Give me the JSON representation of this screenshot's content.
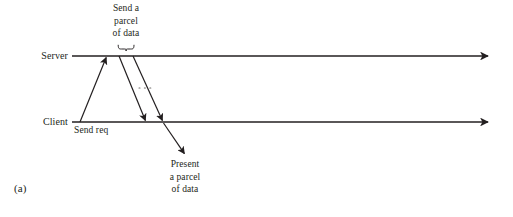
{
  "figure": {
    "caption": "(a)",
    "type": "sequence-timing-diagram",
    "background_color": "#ffffff",
    "line_color": "#231f20",
    "text_color": "#231f20"
  },
  "timelines": [
    {
      "id": "server",
      "label": "Server",
      "y": 56,
      "x_start": 72,
      "x_end": 492,
      "arrowhead": "right"
    },
    {
      "id": "client",
      "label": "Client",
      "y": 122,
      "x_start": 72,
      "x_end": 492,
      "arrowhead": "right"
    }
  ],
  "messages": [
    {
      "id": "send-req",
      "label": "Send req",
      "from": "client",
      "to": "server",
      "x_from": 80,
      "y_from": 122,
      "x_to": 107,
      "y_to": 56,
      "arrowhead": "end"
    },
    {
      "id": "parcel-1",
      "label": "",
      "from": "server",
      "to": "client",
      "x_from": 119,
      "y_from": 56,
      "x_to": 146,
      "y_to": 122,
      "arrowhead": "end"
    },
    {
      "id": "parcel-2",
      "label": "",
      "from": "server",
      "to": "client",
      "x_from": 133,
      "y_from": 56,
      "x_to": 163,
      "y_to": 122,
      "arrowhead": "end"
    },
    {
      "id": "present",
      "label": "Present a parcel of data",
      "from": "client",
      "to": "annotation",
      "x_from": 163,
      "y_from": 122,
      "x_to": 185,
      "y_to": 155,
      "arrowhead": "end"
    }
  ],
  "ellipsis": {
    "id": "continuation-dots",
    "x_start": 138,
    "x_end": 155,
    "y": 88,
    "style": "dotted"
  },
  "brace": {
    "id": "parcel-brace",
    "x_start": 118,
    "x_end": 134,
    "y": 46,
    "orientation": "down"
  },
  "annotations": {
    "send_parcel": {
      "line1": "Send a",
      "line2": "parcel",
      "line3": "of data"
    },
    "send_req": {
      "line1": "Send req"
    },
    "present": {
      "line1": "Present",
      "line2": "a parcel",
      "line3": "of data"
    }
  }
}
